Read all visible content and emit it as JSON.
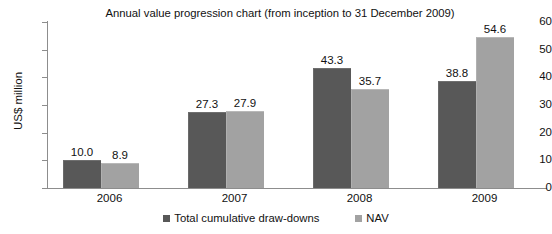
{
  "chart_data": {
    "type": "bar",
    "title": "Annual value progression chart (from inception to 31 December 2009)",
    "xlabel": "",
    "ylabel": "US$ million",
    "categories": [
      "2006",
      "2007",
      "2008",
      "2009"
    ],
    "ylim": [
      0,
      60
    ],
    "yticks": [
      0,
      10,
      20,
      30,
      40,
      50,
      60
    ],
    "ytick_labels": [
      "0",
      "10",
      "20",
      "30",
      "40",
      "50",
      "60"
    ],
    "grid": false,
    "legend_position": "bottom",
    "series": [
      {
        "name": "Total cumulative draw-downs",
        "color": "#585858",
        "values": [
          10.0,
          27.3,
          43.3,
          38.8
        ],
        "labels": [
          "10.0",
          "27.3",
          "43.3",
          "38.8"
        ]
      },
      {
        "name": "NAV",
        "color": "#a2a2a2",
        "values": [
          8.9,
          27.9,
          35.7,
          54.6
        ],
        "labels": [
          "8.9",
          "27.9",
          "35.7",
          "54.6"
        ]
      }
    ]
  }
}
